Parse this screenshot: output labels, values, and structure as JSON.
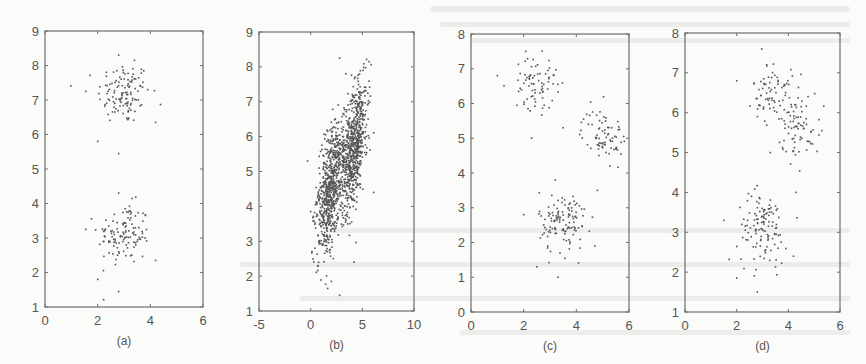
{
  "figure": {
    "background": "#fbfbfa",
    "point_color": "#555555",
    "frame_color": "#6e6e6e"
  },
  "chart_data": [
    {
      "type": "scatter",
      "panel_label": "(a)",
      "title": "",
      "xlabel": "",
      "ylabel": "",
      "xlim": [
        0,
        6
      ],
      "ylim": [
        1,
        9
      ],
      "xticks": [
        0,
        2,
        4,
        6
      ],
      "yticks": [
        1,
        2,
        3,
        4,
        5,
        6,
        7,
        8,
        9
      ],
      "grid": false,
      "frame": {
        "left": 45,
        "top": 31,
        "right": 203,
        "bottom": 307
      },
      "clusters": [
        {
          "center": [
            3.0,
            7.2
          ],
          "std": [
            0.5,
            0.45
          ],
          "n": 120
        },
        {
          "center": [
            3.0,
            3.1
          ],
          "std": [
            0.5,
            0.45
          ],
          "n": 120
        }
      ],
      "sample_points": [
        [
          2.8,
          8.3
        ],
        [
          3.4,
          8.15
        ],
        [
          1.55,
          7.25
        ],
        [
          4.2,
          6.35
        ],
        [
          2.0,
          5.8
        ],
        [
          2.8,
          5.45
        ],
        [
          2.8,
          4.3
        ],
        [
          1.55,
          3.25
        ],
        [
          4.2,
          2.35
        ],
        [
          2.0,
          1.8
        ],
        [
          2.8,
          1.45
        ]
      ]
    },
    {
      "type": "scatter",
      "panel_label": "(b)",
      "title": "",
      "xlabel": "",
      "ylabel": "",
      "xlim": [
        -5,
        10
      ],
      "ylim": [
        1,
        9
      ],
      "xticks": [
        -5,
        0,
        5,
        10
      ],
      "yticks": [
        1,
        2,
        3,
        4,
        5,
        6,
        7,
        8,
        9
      ],
      "grid": false,
      "frame": {
        "left": 259,
        "top": 32,
        "right": 414,
        "bottom": 311
      },
      "clusters": [
        {
          "center": [
            1.9,
            4.5
          ],
          "std": [
            0.55,
            0.95
          ],
          "n": 700,
          "tilt": 0.35
        },
        {
          "center": [
            4.2,
            5.7
          ],
          "std": [
            0.55,
            0.95
          ],
          "n": 700,
          "tilt": 0.35
        }
      ],
      "sample_points": [
        [
          2.8,
          8.25
        ],
        [
          3.4,
          7.8
        ],
        [
          -0.3,
          5.3
        ],
        [
          0.0,
          3.85
        ],
        [
          6.1,
          4.4
        ],
        [
          4.2,
          2.4
        ],
        [
          2.0,
          1.85
        ],
        [
          2.8,
          1.45
        ]
      ]
    },
    {
      "type": "scatter",
      "panel_label": "(c)",
      "title": "",
      "xlabel": "",
      "ylabel": "",
      "xlim": [
        0,
        6
      ],
      "ylim": [
        0,
        8
      ],
      "xticks": [
        0,
        2,
        4,
        6
      ],
      "yticks": [
        0,
        1,
        2,
        3,
        4,
        5,
        6,
        7,
        8
      ],
      "grid": false,
      "frame": {
        "left": 471,
        "top": 34,
        "right": 629,
        "bottom": 312
      },
      "clusters": [
        {
          "center": [
            2.45,
            6.6
          ],
          "std": [
            0.4,
            0.38
          ],
          "n": 75
        },
        {
          "center": [
            5.0,
            5.1
          ],
          "std": [
            0.4,
            0.38
          ],
          "n": 75
        },
        {
          "center": [
            3.5,
            2.6
          ],
          "std": [
            0.45,
            0.45
          ],
          "n": 120
        }
      ],
      "sample_points": [
        [
          1.0,
          6.8
        ],
        [
          3.3,
          6.55
        ],
        [
          2.3,
          5.0
        ],
        [
          3.5,
          5.3
        ],
        [
          5.8,
          5.05
        ],
        [
          3.2,
          3.8
        ],
        [
          2.0,
          2.8
        ],
        [
          4.8,
          3.5
        ],
        [
          4.7,
          1.9
        ],
        [
          2.5,
          1.3
        ],
        [
          3.3,
          1.0
        ]
      ]
    },
    {
      "type": "scatter",
      "panel_label": "(d)",
      "title": "",
      "xlabel": "",
      "ylabel": "",
      "xlim": [
        0,
        6
      ],
      "ylim": [
        1,
        8
      ],
      "xticks": [
        0,
        2,
        4,
        6
      ],
      "yticks": [
        1,
        2,
        3,
        4,
        5,
        6,
        7,
        8
      ],
      "grid": false,
      "frame": {
        "left": 685,
        "top": 33,
        "right": 840,
        "bottom": 312
      },
      "clusters": [
        {
          "center": [
            3.4,
            6.5
          ],
          "std": [
            0.38,
            0.4
          ],
          "n": 75
        },
        {
          "center": [
            4.4,
            5.7
          ],
          "std": [
            0.4,
            0.4
          ],
          "n": 75
        },
        {
          "center": [
            3.0,
            3.1
          ],
          "std": [
            0.48,
            0.45
          ],
          "n": 120
        }
      ],
      "sample_points": [
        [
          2.0,
          6.8
        ],
        [
          5.3,
          5.55
        ],
        [
          3.3,
          5.0
        ],
        [
          4.3,
          4.0
        ],
        [
          1.5,
          3.3
        ],
        [
          4.2,
          2.4
        ],
        [
          2.0,
          1.85
        ],
        [
          2.8,
          1.5
        ]
      ]
    }
  ]
}
